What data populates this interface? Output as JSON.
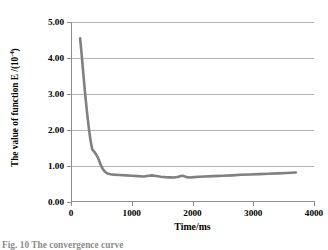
{
  "chart_data": {
    "type": "line",
    "title": "",
    "xlabel": "Time/ms",
    "ylabel_text": "The value of function E /(10",
    "ylabel_exponent": "-4",
    "ylabel_tail": ")",
    "ylabel_full": "The value of function E /(10-4)",
    "xlim": [
      0,
      4000
    ],
    "ylim": [
      0,
      5
    ],
    "xticks": [
      "0",
      "1000",
      "2000",
      "3000",
      "4000"
    ],
    "xtick_values": [
      0,
      1000,
      2000,
      3000,
      4000
    ],
    "yticks": [
      "0.00",
      "1.00",
      "2.00",
      "3.00",
      "4.00",
      "5.00"
    ],
    "ytick_values": [
      0,
      1,
      2,
      3,
      4,
      5
    ],
    "grid": "horizontal",
    "legend": "none",
    "series_color": "#808080",
    "series_width": 2.6,
    "series": [
      {
        "name": "function E",
        "x": [
          150,
          175,
          200,
          230,
          260,
          290,
          320,
          350,
          380,
          410,
          440,
          470,
          500,
          530,
          560,
          600,
          650,
          700,
          800,
          900,
          1000,
          1100,
          1200,
          1280,
          1330,
          1400,
          1480,
          1550,
          1620,
          1700,
          1770,
          1820,
          1860,
          1900,
          1960,
          2030,
          2100,
          2200,
          2350,
          2500,
          2650,
          2800,
          2950,
          3100,
          3250,
          3400,
          3550,
          3700
        ],
        "y": [
          4.55,
          4.1,
          3.62,
          3.05,
          2.55,
          2.1,
          1.72,
          1.46,
          1.4,
          1.33,
          1.24,
          1.12,
          0.99,
          0.9,
          0.84,
          0.79,
          0.77,
          0.76,
          0.75,
          0.74,
          0.73,
          0.72,
          0.71,
          0.73,
          0.74,
          0.72,
          0.7,
          0.69,
          0.685,
          0.68,
          0.7,
          0.73,
          0.72,
          0.69,
          0.68,
          0.69,
          0.7,
          0.71,
          0.72,
          0.73,
          0.74,
          0.755,
          0.765,
          0.775,
          0.785,
          0.795,
          0.805,
          0.82
        ]
      }
    ]
  },
  "caption": {
    "text": "Fig. 10   The convergence curve"
  }
}
